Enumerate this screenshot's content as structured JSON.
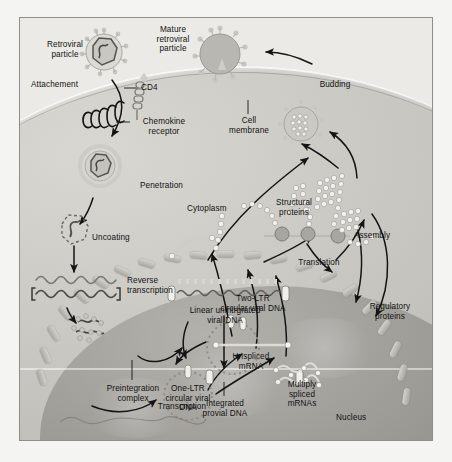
{
  "figure": {
    "type": "diagram"
  },
  "labels": {
    "retroviral_particle": "Retroviral\nparticle",
    "mature_retroviral_particle": "Mature\nretroviral\nparticle",
    "attachment": "Attachement",
    "cd4": "CD4",
    "chemokine_receptor": "Chemokine\nreceptor",
    "cell_membrane": "Cell\nmembrane",
    "budding": "Budding",
    "penetration": "Penetration",
    "cytoplasm": "Cytoplasm",
    "uncoating": "Uncoating",
    "reverse_transcription": "Reverse\ntranscription",
    "assembly": "Assembly",
    "structural_proteins": "Structural\nproteins",
    "translation": "Translation",
    "regulatory_proteins": "Regulatory\nproteins",
    "preintegration_complex": "Preintegration\ncomplex",
    "linear_unintegrated_viral_dna": "Linear unintrgrated\nviral DNA",
    "two_ltr_circular_viral_dna": "Two-LTR\ncircular viral DNA",
    "one_ltr_circular_viral_dna": "One-LTR\ncircular viral\nDNA",
    "integrated_proviral_dna": "Integrated\nprovial DNA",
    "unspliced_mrna": "Unspliced\nmRNA",
    "multiply_spliced_mrnas": "Multiply\nspliced\nmRNAs",
    "transcription": "Transcription",
    "nucleus": "Nucleus"
  },
  "colors": {
    "page_background": "#f4f4f2",
    "panel_background": "#eceae6",
    "frame_border": "#8d8d8d",
    "cytoplasm": "#c9c7c2",
    "nucleoplasm": "#9b9994",
    "nuclear_pore": "#c2c0bb",
    "arrow": "#141414",
    "label_text": "#111111",
    "capsid_outline": "#6d6b66",
    "protein_bead": "#efeeea",
    "rna_strand": "#8a8884"
  }
}
